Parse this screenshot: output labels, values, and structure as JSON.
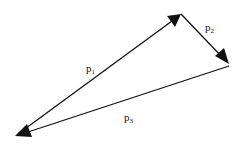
{
  "diagram": {
    "type": "vector-triangle",
    "background": "#ffffff",
    "stroke_color": "#111111",
    "points": {
      "A": {
        "x": 18,
        "y": 134
      },
      "B": {
        "x": 181,
        "y": 14
      },
      "C": {
        "x": 229,
        "y": 64
      }
    },
    "vectors": [
      {
        "id": "p1",
        "label_base": "p",
        "label_sub": "1",
        "from": "A",
        "to": "B",
        "label_pos": {
          "x": 86,
          "y": 72
        }
      },
      {
        "id": "p2",
        "label_base": "p",
        "label_sub": "2",
        "from": "B",
        "to": "C",
        "label_pos": {
          "x": 205,
          "y": 31
        }
      },
      {
        "id": "p3",
        "label_base": "p",
        "label_sub": "3",
        "from": "C",
        "to": "A",
        "label_pos": {
          "x": 124,
          "y": 121
        }
      }
    ]
  }
}
